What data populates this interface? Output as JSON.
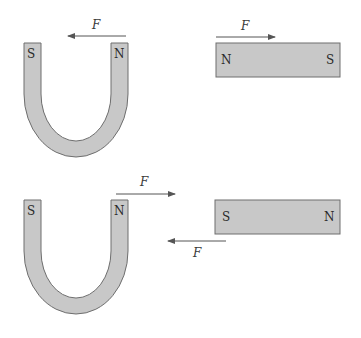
{
  "diagram": {
    "panels": [
      {
        "id": "top",
        "horseshoe": {
          "left_pole": "S",
          "right_pole": "N"
        },
        "horseshoe_force": {
          "label": "F",
          "direction": "left"
        },
        "bar": {
          "left_pole": "N",
          "right_pole": "S"
        },
        "bar_force": {
          "label": "F",
          "direction": "right"
        }
      },
      {
        "id": "bottom",
        "horseshoe": {
          "left_pole": "S",
          "right_pole": "N"
        },
        "horseshoe_force": {
          "label": "F",
          "direction": "right"
        },
        "bar": {
          "left_pole": "S",
          "right_pole": "N"
        },
        "bar_force": {
          "label": "F",
          "direction": "left"
        }
      }
    ],
    "colors": {
      "magnet_fill": "#c8c8c8",
      "magnet_stroke": "#6e6e6e",
      "arrow": "#555555"
    }
  }
}
